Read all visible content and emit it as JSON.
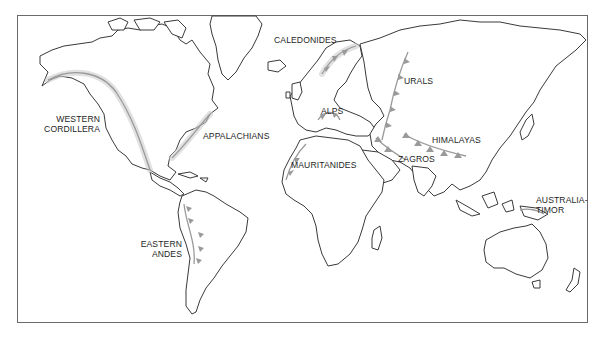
{
  "map": {
    "type": "world-outline-map",
    "theme": "mountain belts / orogenic belts",
    "colors": {
      "background": "#ffffff",
      "coastline": "#3a3a3a",
      "belt": "#9a9a9a",
      "frame": "#6a6a6a",
      "label": "#1e1e1e"
    },
    "labels": {
      "caledonides": "CALEDONIDES",
      "western_cordillera_1": "WESTERN",
      "western_cordillera_2": "CORDILLERA",
      "appalachians": "APPALACHIANS",
      "alps": "ALPS",
      "urals": "URALS",
      "himalayas": "HIMALAYAS",
      "zagros": "ZAGROS",
      "mauritanides": "MAURITANIDES",
      "australia_timor_1": "AUSTRALIA-",
      "australia_timor_2": "TIMOR",
      "eastern_andes_1": "EASTERN",
      "eastern_andes_2": "ANDES"
    }
  }
}
